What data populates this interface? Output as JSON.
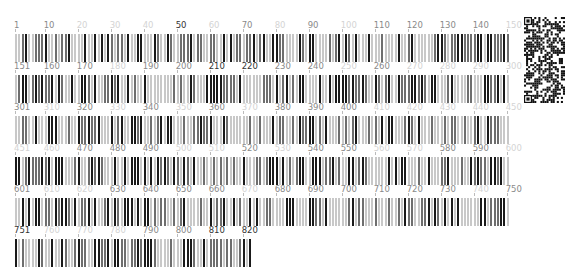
{
  "sequence_view": {
    "total_positions": 822,
    "positions_per_row": 150,
    "rows": [
      {
        "start": 1,
        "end": 150,
        "labels": [
          {
            "text": "1",
            "pos": 1,
            "dark": false
          },
          {
            "text": "10",
            "pos": 10,
            "dark": false
          },
          {
            "text": "20",
            "pos": 20,
            "dark": false,
            "faint": true
          },
          {
            "text": "30",
            "pos": 30,
            "faint": true
          },
          {
            "text": "40",
            "pos": 40,
            "faint": true
          },
          {
            "text": "50",
            "pos": 50,
            "dark": true
          },
          {
            "text": "60",
            "pos": 60,
            "faint": true
          },
          {
            "text": "70",
            "pos": 70
          },
          {
            "text": "80",
            "pos": 80,
            "faint": true
          },
          {
            "text": "90",
            "pos": 90
          },
          {
            "text": "100",
            "pos": 100,
            "faint": true
          },
          {
            "text": "110",
            "pos": 110
          },
          {
            "text": "120",
            "pos": 120
          },
          {
            "text": "130",
            "pos": 130
          },
          {
            "text": "140",
            "pos": 140
          },
          {
            "text": "150",
            "pos": 150,
            "faint": true
          }
        ]
      },
      {
        "start": 151,
        "end": 300,
        "labels": [
          {
            "text": "151",
            "pos": 151
          },
          {
            "text": "160",
            "pos": 160
          },
          {
            "text": "170",
            "pos": 170
          },
          {
            "text": "180",
            "pos": 180,
            "faint": true
          },
          {
            "text": "190",
            "pos": 190
          },
          {
            "text": "200",
            "pos": 200
          },
          {
            "text": "210",
            "pos": 210,
            "dark": true
          },
          {
            "text": "220",
            "pos": 220,
            "dark": true
          },
          {
            "text": "230",
            "pos": 230
          },
          {
            "text": "240",
            "pos": 240
          },
          {
            "text": "250",
            "pos": 250,
            "faint": true
          },
          {
            "text": "260",
            "pos": 260
          },
          {
            "text": "270",
            "pos": 270,
            "faint": true
          },
          {
            "text": "280",
            "pos": 280,
            "faint": true
          },
          {
            "text": "290",
            "pos": 290,
            "faint": true
          },
          {
            "text": "300",
            "pos": 300,
            "faint": true
          }
        ]
      },
      {
        "start": 301,
        "end": 450,
        "labels": [
          {
            "text": "301",
            "pos": 301
          },
          {
            "text": "310",
            "pos": 310,
            "faint": true
          },
          {
            "text": "320",
            "pos": 320
          },
          {
            "text": "330",
            "pos": 330,
            "faint": true
          },
          {
            "text": "340",
            "pos": 340
          },
          {
            "text": "350",
            "pos": 350,
            "faint": true
          },
          {
            "text": "360",
            "pos": 360
          },
          {
            "text": "370",
            "pos": 370,
            "faint": true
          },
          {
            "text": "380",
            "pos": 380
          },
          {
            "text": "390",
            "pos": 390
          },
          {
            "text": "400",
            "pos": 400
          },
          {
            "text": "410",
            "pos": 410,
            "faint": true
          },
          {
            "text": "420",
            "pos": 420,
            "faint": true
          },
          {
            "text": "430",
            "pos": 430,
            "faint": true
          },
          {
            "text": "440",
            "pos": 440,
            "faint": true
          },
          {
            "text": "450",
            "pos": 450,
            "faint": true
          }
        ]
      },
      {
        "start": 451,
        "end": 600,
        "labels": [
          {
            "text": "451",
            "pos": 451,
            "faint": true
          },
          {
            "text": "460",
            "pos": 460,
            "faint": true
          },
          {
            "text": "470",
            "pos": 470
          },
          {
            "text": "480",
            "pos": 480
          },
          {
            "text": "490",
            "pos": 490
          },
          {
            "text": "500",
            "pos": 500,
            "faint": true
          },
          {
            "text": "510",
            "pos": 510,
            "faint": true
          },
          {
            "text": "520",
            "pos": 520
          },
          {
            "text": "530",
            "pos": 530,
            "faint": true
          },
          {
            "text": "540",
            "pos": 540
          },
          {
            "text": "550",
            "pos": 550
          },
          {
            "text": "560",
            "pos": 560,
            "faint": true
          },
          {
            "text": "570",
            "pos": 570,
            "faint": true
          },
          {
            "text": "580",
            "pos": 580
          },
          {
            "text": "590",
            "pos": 590
          },
          {
            "text": "600",
            "pos": 600,
            "faint": true
          }
        ]
      },
      {
        "start": 601,
        "end": 750,
        "labels": [
          {
            "text": "601",
            "pos": 601
          },
          {
            "text": "610",
            "pos": 610,
            "faint": true
          },
          {
            "text": "620",
            "pos": 620,
            "faint": true
          },
          {
            "text": "630",
            "pos": 630
          },
          {
            "text": "640",
            "pos": 640
          },
          {
            "text": "650",
            "pos": 650
          },
          {
            "text": "660",
            "pos": 660
          },
          {
            "text": "670",
            "pos": 670,
            "faint": true
          },
          {
            "text": "680",
            "pos": 680
          },
          {
            "text": "690",
            "pos": 690
          },
          {
            "text": "700",
            "pos": 700
          },
          {
            "text": "710",
            "pos": 710
          },
          {
            "text": "720",
            "pos": 720
          },
          {
            "text": "730",
            "pos": 730
          },
          {
            "text": "740",
            "pos": 740,
            "faint": true
          },
          {
            "text": "750",
            "pos": 750
          }
        ]
      },
      {
        "start": 751,
        "end": 822,
        "labels": [
          {
            "text": "751",
            "pos": 751,
            "dark": true
          },
          {
            "text": "760",
            "pos": 760,
            "faint": true
          },
          {
            "text": "770",
            "pos": 770,
            "faint": true
          },
          {
            "text": "780",
            "pos": 780,
            "faint": true
          },
          {
            "text": "790",
            "pos": 790
          },
          {
            "text": "800",
            "pos": 800
          },
          {
            "text": "810",
            "pos": 810,
            "dark": true
          },
          {
            "text": "820",
            "pos": 820,
            "dark": true
          }
        ]
      }
    ]
  },
  "colors": {
    "bar_dark": "#1a1a1a",
    "bar_mid": "#6e6e6e",
    "bar_light": "#c8c8c8",
    "label_normal": "#8a8a8a",
    "label_dark": "#333333",
    "label_faint": "#d4d4d4"
  },
  "qr_code": {
    "icon": "qr-code-icon"
  }
}
